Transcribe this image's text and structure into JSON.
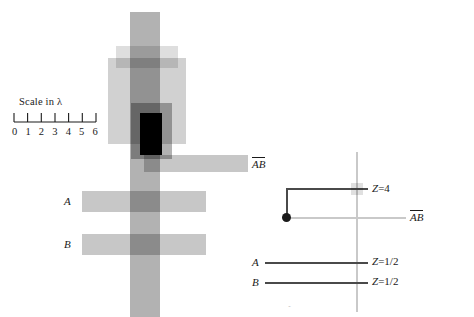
{
  "figure": {
    "scale": {
      "caption": "Scale in λ",
      "ticks": [
        "0",
        "1",
        "2",
        "3",
        "4",
        "5",
        "6"
      ],
      "unit": "λ",
      "tick_count": 7
    },
    "left_diagram": {
      "labels": {
        "ab": "AB",
        "a": "A",
        "b": "B"
      },
      "blocks": [
        {
          "name": "vertical-main-bar",
          "x": 130,
          "y": 12,
          "w": 30,
          "h": 305,
          "opacity": 0.3
        },
        {
          "name": "upper-light-rect",
          "x": 116,
          "y": 46,
          "w": 62,
          "h": 22,
          "opacity": 0.13
        },
        {
          "name": "mid-wide-rect",
          "x": 108,
          "y": 58,
          "w": 78,
          "h": 86,
          "opacity": 0.18
        },
        {
          "name": "inner-dark-rect",
          "x": 131,
          "y": 103,
          "w": 41,
          "h": 56,
          "opacity": 0.3
        },
        {
          "name": "core-black-rect",
          "x": 140,
          "y": 113,
          "w": 22,
          "h": 42,
          "opacity": 1.0
        },
        {
          "name": "ab-horizontal-bar",
          "x": 144,
          "y": 155,
          "w": 104,
          "h": 17,
          "opacity": 0.22
        },
        {
          "name": "a-horizontal-bar",
          "x": 82,
          "y": 191,
          "w": 124,
          "h": 21,
          "opacity": 0.22
        },
        {
          "name": "b-horizontal-bar",
          "x": 82,
          "y": 234,
          "w": 124,
          "h": 21,
          "opacity": 0.22
        }
      ]
    },
    "right_diagram": {
      "labels": {
        "ab": "AB",
        "a": "A",
        "b": "B"
      },
      "annotations": [
        {
          "name": "z-equals-4",
          "var": "Z",
          "eq": "=",
          "value": "4"
        },
        {
          "name": "z-equals-one-half-a",
          "var": "Z",
          "eq": "=",
          "value": "1/2"
        },
        {
          "name": "z-equals-one-half-b",
          "var": "Z",
          "eq": "=",
          "value": "1/2"
        }
      ]
    },
    "bottom_caption": "fold in a cavity-backed slot antenna"
  },
  "colors": {
    "ink": "#1a1a1a",
    "block": "#000000",
    "axis_light": "#c9c9c9",
    "line_dark": "#4a4a4a",
    "paper": "#ffffff"
  }
}
